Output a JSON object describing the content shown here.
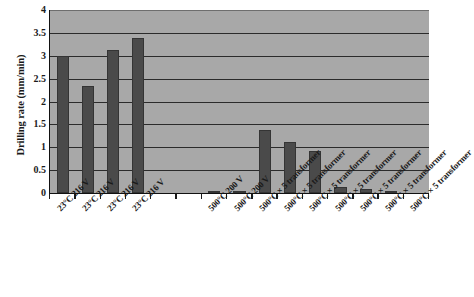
{
  "chart_data": {
    "type": "bar",
    "title": "",
    "xlabel": "",
    "ylabel": "Drilling rate (mm/min)",
    "ylim": [
      0,
      4
    ],
    "ytick_step": 0.5,
    "yticks": [
      "4",
      "3.5",
      "3",
      "2.5",
      "2",
      "1.5",
      "1",
      "0.5",
      "0"
    ],
    "ytick_values": [
      4,
      3.5,
      3,
      2.5,
      2,
      1.5,
      1,
      0.5,
      0
    ],
    "grid": true,
    "grid_axis": "y",
    "legend": false,
    "plot_background_color": "#a8a8a8",
    "bar_color": "#4a4a4a",
    "axis_color": "#111111",
    "categories": [
      "23°C 216 V",
      "23°C 216 V",
      "23°C 216 V",
      "23°C 216 V",
      "",
      "",
      "500°C 200 V",
      "500°C 200 V",
      "500°C × 5 transformer",
      "500°C × 5 transformer",
      "500°C × 5 transformer",
      "500°C × 5 transformer",
      "500°C × 5 transformer",
      "500°C × 5 transformer",
      "500°C × 5 transformer"
    ],
    "values": [
      3.0,
      2.33,
      3.13,
      3.38,
      null,
      null,
      0.04,
      0.03,
      1.38,
      1.12,
      0.92,
      0.13,
      0.08,
      0.02,
      null
    ]
  }
}
